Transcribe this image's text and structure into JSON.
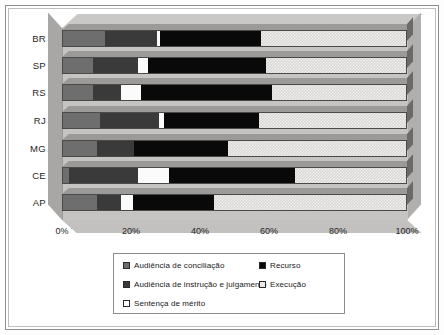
{
  "chart_data": {
    "type": "bar",
    "orientation": "horizontal",
    "stacked": true,
    "stack_mode": "percent",
    "title": "",
    "subtitle": "",
    "xlabel": "",
    "ylabel": "",
    "xlim": [
      0,
      100
    ],
    "xticks": [
      0,
      20,
      40,
      60,
      80,
      100
    ],
    "xticklabels": [
      "0%",
      "20%",
      "40%",
      "60%",
      "80%",
      "100%"
    ],
    "grid": false,
    "legend_position": "bottom",
    "categories": [
      "BR",
      "SP",
      "RS",
      "RJ",
      "MG",
      "CE",
      "AP"
    ],
    "series": [
      {
        "name": "Audiência de conciliação",
        "color": "#6e6e6e",
        "values": [
          12.5,
          9.0,
          9.0,
          11.0,
          10.0,
          2.0,
          10.0
        ]
      },
      {
        "name": "Audiência de instrução e julgamento",
        "color": "#3a3a3a",
        "values": [
          15.0,
          13.0,
          8.0,
          17.0,
          11.0,
          20.0,
          7.0
        ]
      },
      {
        "name": "Sentença de mérito",
        "color": "#ffffff",
        "values": [
          1.0,
          3.0,
          6.0,
          1.5,
          0.0,
          9.0,
          3.5
        ]
      },
      {
        "name": "Recurso",
        "color": "#090909",
        "values": [
          29.2,
          34.0,
          38.0,
          27.5,
          27.0,
          36.5,
          23.5
        ]
      },
      {
        "name": "Execução",
        "color": "#dedddb",
        "values": [
          42.3,
          41.0,
          39.0,
          43.0,
          52.0,
          32.5,
          56.0
        ]
      }
    ]
  },
  "legend": {
    "entries": [
      {
        "label": "Audiência de conciliação",
        "swatch": "sA"
      },
      {
        "label": "Recurso",
        "swatch": "sD"
      },
      {
        "label": "Audiência de instrução e julgamento",
        "swatch": "sB"
      },
      {
        "label": "Execução",
        "swatch": "sE"
      },
      {
        "label": "Sentença de mérito",
        "swatch": "sC"
      }
    ]
  }
}
